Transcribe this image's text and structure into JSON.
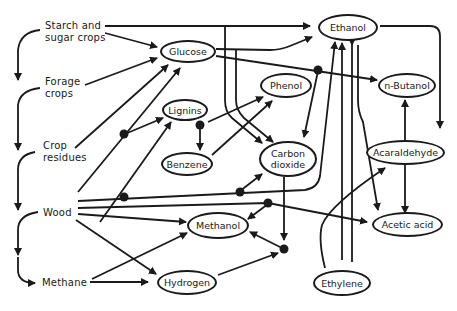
{
  "diagram": {
    "type": "flowchart",
    "sources": [
      {
        "id": "starch",
        "label_line1": "Starch and",
        "label_line2": "sugar crops"
      },
      {
        "id": "forage",
        "label_line1": "Forage",
        "label_line2": "crops"
      },
      {
        "id": "crop_residues",
        "label_line1": "Crop",
        "label_line2": "residues"
      },
      {
        "id": "wood",
        "label_line1": "Wood"
      },
      {
        "id": "methane",
        "label_line1": "Methane"
      }
    ],
    "nodes": [
      {
        "id": "glucose",
        "label": "Glucose"
      },
      {
        "id": "ethanol",
        "label": "Ethanol"
      },
      {
        "id": "lignins",
        "label": "Lignins"
      },
      {
        "id": "phenol",
        "label": "Phenol"
      },
      {
        "id": "n_butanol",
        "label": "n-Butanol"
      },
      {
        "id": "benzene",
        "label": "Benzene"
      },
      {
        "id": "carbon_dioxide",
        "label_line1": "Carbon",
        "label_line2": "dioxide"
      },
      {
        "id": "acaraldehyde",
        "label": "Acaraldehyde"
      },
      {
        "id": "methanol",
        "label": "Methanol"
      },
      {
        "id": "acetic_acid",
        "label": "Acetic acid"
      },
      {
        "id": "hydrogen",
        "label": "Hydrogen"
      },
      {
        "id": "ethylene",
        "label": "Ethylene"
      }
    ],
    "edges": [
      {
        "from": "Starch and sugar crops",
        "to": "Ethanol"
      },
      {
        "from": "Starch and sugar crops",
        "to": "Glucose"
      },
      {
        "from": "Starch and sugar crops",
        "to": "Forage crops"
      },
      {
        "from": "Forage crops",
        "to": "Glucose"
      },
      {
        "from": "Forage crops",
        "to": "Crop residues"
      },
      {
        "from": "Crop residues",
        "to": "Glucose"
      },
      {
        "from": "Crop residues",
        "to": "Wood"
      },
      {
        "from": "Wood",
        "to": "Glucose"
      },
      {
        "from": "Wood",
        "to": "Lignins"
      },
      {
        "from": "Wood",
        "to": "Ethanol"
      },
      {
        "from": "Wood",
        "to": "Carbon dioxide"
      },
      {
        "from": "Wood",
        "to": "Methanol"
      },
      {
        "from": "Wood",
        "to": "Acetic acid"
      },
      {
        "from": "Wood",
        "to": "Hydrogen"
      },
      {
        "from": "Wood",
        "to": "Methane"
      },
      {
        "from": "Methane",
        "to": "Methanol"
      },
      {
        "from": "Methane",
        "to": "Hydrogen"
      },
      {
        "from": "Glucose",
        "to": "Ethanol"
      },
      {
        "from": "Glucose",
        "to": "n-Butanol"
      },
      {
        "from": "Glucose",
        "to": "Carbon dioxide"
      },
      {
        "from": "Lignins",
        "to": "Phenol"
      },
      {
        "from": "Lignins",
        "to": "Benzene"
      },
      {
        "from": "Benzene",
        "to": "Phenol"
      },
      {
        "from": "Ethanol",
        "to": "Acaraldehyde"
      },
      {
        "from": "Acaraldehyde",
        "to": "n-Butanol"
      },
      {
        "from": "Acaraldehyde",
        "to": "Acetic acid"
      },
      {
        "from": "Ethanol",
        "to": "Acetic acid"
      },
      {
        "from": "Ethanol",
        "to": "Ethylene"
      },
      {
        "from": "Ethylene",
        "to": "Ethanol"
      },
      {
        "from": "Ethylene",
        "to": "Acaraldehyde"
      },
      {
        "from": "Carbon dioxide",
        "to": "Methanol"
      },
      {
        "from": "Hydrogen",
        "to": "Methanol"
      }
    ]
  }
}
